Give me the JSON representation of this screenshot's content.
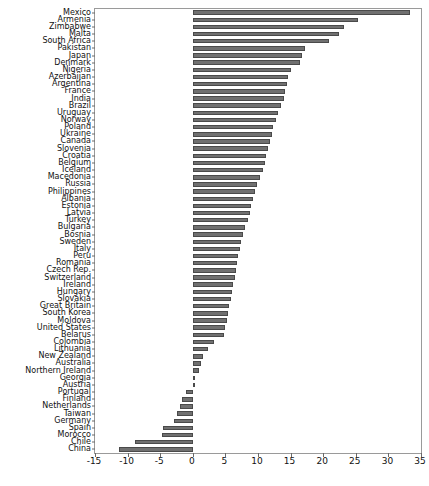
{
  "chart_data": {
    "type": "bar",
    "orientation": "horizontal",
    "title": "",
    "subtitle": "",
    "xlabel": "",
    "ylabel": "",
    "xlim": [
      -15,
      35
    ],
    "xticks": [
      -15,
      -10,
      -5,
      0,
      5,
      10,
      15,
      20,
      25,
      30,
      35
    ],
    "grid": false,
    "legend": null,
    "bar_color": "#707070",
    "bar_edge_color": "#4a4a4a",
    "categories": [
      "Mexico",
      "Armenia",
      "Zimbabwe",
      "Malta",
      "South Africa",
      "Pakistan",
      "Japan",
      "Denmark",
      "Nigeria",
      "Azerbaijan",
      "Argentina",
      "France",
      "India",
      "Brazil",
      "Uruguay",
      "Norway",
      "Poland",
      "Ukraine",
      "Canada",
      "Slovenia",
      "Croatia",
      "Belgium",
      "Iceland",
      "Macedonia",
      "Russia",
      "Philippines",
      "Albania",
      "Estonia",
      "Latvia",
      "Turkey",
      "Bulgaria",
      "Bosnia",
      "Sweden",
      "Italy",
      "Peru",
      "Romania",
      "Czech Rep.",
      "Switzerland",
      "Ireland",
      "Hungary",
      "Slovakia",
      "Great Britain",
      "South Korea",
      "Moldova",
      "United States",
      "Belarus",
      "Colombia",
      "Lithuania",
      "New Zealand",
      "Australia",
      "Northern Ireland",
      "Georgia",
      "Austria",
      "Portugal",
      "Finland",
      "Netherlands",
      "Taiwan",
      "Germany",
      "Spain",
      "Morocco",
      "Chile",
      "China"
    ],
    "values": [
      33.3,
      25.3,
      23.2,
      22.4,
      20.9,
      17.2,
      16.8,
      16.5,
      15.0,
      14.6,
      14.4,
      14.2,
      14.0,
      13.6,
      13.0,
      12.7,
      12.3,
      12.1,
      11.8,
      11.5,
      11.2,
      11.0,
      10.8,
      10.3,
      9.8,
      9.5,
      9.2,
      9.0,
      8.8,
      8.5,
      8.0,
      7.7,
      7.4,
      7.2,
      7.0,
      6.8,
      6.6,
      6.4,
      6.2,
      6.0,
      5.8,
      5.6,
      5.4,
      5.2,
      5.0,
      4.8,
      3.2,
      2.4,
      1.5,
      1.2,
      1.0,
      0.3,
      0.1,
      -1.0,
      -1.6,
      -2.0,
      -2.4,
      -2.9,
      -4.5,
      -4.7,
      -8.8,
      -11.3
    ]
  }
}
